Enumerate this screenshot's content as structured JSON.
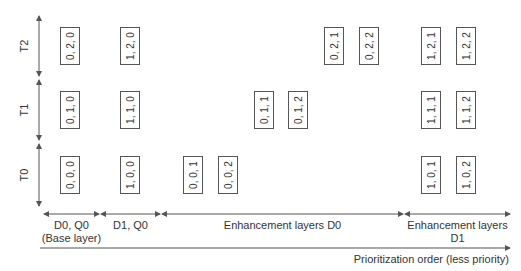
{
  "rows": [
    {
      "label": "T2",
      "y": 46
    },
    {
      "label": "T1",
      "y": 110
    },
    {
      "label": "T0",
      "y": 175
    }
  ],
  "boxes": [
    {
      "text": "0, 2, 0",
      "x": 70,
      "row": 0
    },
    {
      "text": "1, 2, 0",
      "x": 130,
      "row": 0
    },
    {
      "text": "0, 2, 1",
      "x": 334,
      "row": 0
    },
    {
      "text": "0, 2, 2",
      "x": 369,
      "row": 0
    },
    {
      "text": "1, 2, 1",
      "x": 431,
      "row": 0
    },
    {
      "text": "1, 2, 2",
      "x": 466,
      "row": 0
    },
    {
      "text": "0, 1, 0",
      "x": 70,
      "row": 1
    },
    {
      "text": "1, 1, 0",
      "x": 130,
      "row": 1
    },
    {
      "text": "0, 1, 1",
      "x": 264,
      "row": 1
    },
    {
      "text": "0, 1, 2",
      "x": 298,
      "row": 1
    },
    {
      "text": "1, 1, 1",
      "x": 431,
      "row": 1
    },
    {
      "text": "1, 1, 2",
      "x": 466,
      "row": 1
    },
    {
      "text": "0, 0, 0",
      "x": 70,
      "row": 2
    },
    {
      "text": "1, 0, 0",
      "x": 130,
      "row": 2
    },
    {
      "text": "0, 0, 1",
      "x": 193,
      "row": 2
    },
    {
      "text": "0, 0, 2",
      "x": 228,
      "row": 2
    },
    {
      "text": "1, 0, 1",
      "x": 431,
      "row": 2
    },
    {
      "text": "1, 0, 2",
      "x": 466,
      "row": 2
    }
  ],
  "segments": [
    {
      "line1": "D0, Q0",
      "line2": "(Base layer)",
      "x1": 44,
      "x2": 99
    },
    {
      "line1": "D1, Q0",
      "line2": "",
      "x1": 101,
      "x2": 160
    },
    {
      "line1": "Enhancement layers D0",
      "line2": "",
      "x1": 162,
      "x2": 403
    },
    {
      "line1": "Enhancement layers",
      "line2": "D1",
      "x1": 405,
      "x2": 510
    }
  ],
  "axis": {
    "prioritization_label": "Prioritization order (less priority)"
  },
  "colors": {
    "line": "#555555",
    "text": "#333333"
  }
}
